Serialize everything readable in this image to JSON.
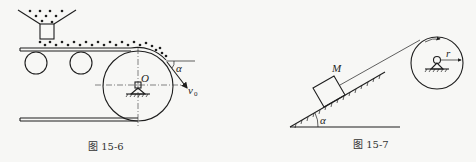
{
  "figures": [
    {
      "id": "fig-15-6",
      "caption": "图 15-6",
      "labels": {
        "center": "O",
        "angle": "α",
        "velocity": "v",
        "velocity_sub": "0"
      }
    },
    {
      "id": "fig-15-7",
      "caption": "图 15-7",
      "labels": {
        "mass": "M",
        "angle": "α",
        "radius": "r"
      }
    }
  ],
  "colors": {
    "ink": "#1e1e1e",
    "paper": "#f7f7f5"
  }
}
